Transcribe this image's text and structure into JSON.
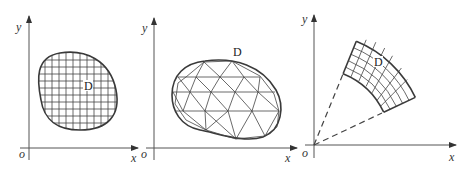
{
  "figure": {
    "colors": {
      "background": "#ffffff",
      "line": "#3a3a3a",
      "axis": "#555555"
    },
    "panels": [
      {
        "id": "rectangular-grid",
        "axis_labels": {
          "y": "y",
          "x": "x",
          "origin": "o"
        },
        "region_label": "D",
        "partition": "rectangular grid"
      },
      {
        "id": "triangular-mesh",
        "axis_labels": {
          "y": "y",
          "x": "x",
          "origin": "o"
        },
        "region_label": "D",
        "partition": "triangular mesh"
      },
      {
        "id": "polar-grid",
        "axis_labels": {
          "y": "y",
          "x": "x",
          "origin": "o"
        },
        "region_label": "D",
        "partition": "polar (annular sector) grid"
      }
    ]
  }
}
